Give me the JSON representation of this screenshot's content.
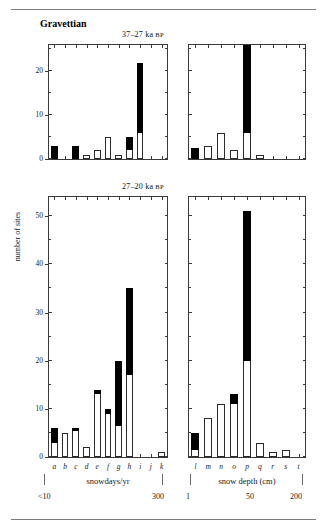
{
  "figure": {
    "culture_label": "Gravettian",
    "y_axis_label": "number of sites"
  },
  "titles": {
    "top": "37–27 ka ",
    "top_sc": "BP",
    "bottom": "27–20 ka ",
    "bottom_sc": "BP"
  },
  "axes": {
    "left_name": "snowdays/yr",
    "right_name": "snow depth (cm)",
    "left_start": "<10",
    "left_end": "300",
    "right_start": "1",
    "right_mid": "50",
    "right_end": "200"
  },
  "categories": {
    "snowdays": [
      "a",
      "b",
      "c",
      "d",
      "e",
      "f",
      "g",
      "h",
      "i",
      "j",
      "k"
    ],
    "snowdepth": [
      "l",
      "m",
      "n",
      "o",
      "p",
      "q",
      "r",
      "s",
      "t"
    ]
  },
  "colors": {
    "filled": "#000000",
    "open": "#ffffff",
    "outline": "#2b2b2b",
    "frame": "#3a3a3a"
  },
  "chart_data": [
    {
      "type": "bar",
      "id": "top-left",
      "title": "37–27 ka BP",
      "xlabel": "snowdays/yr",
      "ylabel": "number of sites",
      "ylim": [
        0,
        26
      ],
      "yticks": [
        0,
        10,
        20
      ],
      "grid": false,
      "legend": null,
      "stacked": true,
      "categories": [
        "a",
        "b",
        "c",
        "d",
        "e",
        "f",
        "g",
        "h",
        "i",
        "j",
        "k"
      ],
      "series": [
        {
          "name": "open",
          "values": [
            0,
            0,
            0,
            1,
            2,
            5,
            1,
            2,
            6,
            0,
            0
          ]
        },
        {
          "name": "filled",
          "values": [
            3,
            0,
            3,
            0,
            0,
            0,
            0,
            3,
            16,
            0,
            0
          ]
        }
      ],
      "totals": [
        3,
        0,
        3,
        1,
        2,
        5,
        1,
        5,
        22,
        0,
        0
      ]
    },
    {
      "type": "bar",
      "id": "top-right",
      "title": "37–27 ka BP",
      "xlabel": "snow depth (cm)",
      "ylabel": "number of sites",
      "ylim": [
        0,
        26
      ],
      "yticks": [
        0,
        10,
        20
      ],
      "grid": false,
      "legend": null,
      "stacked": true,
      "categories": [
        "l",
        "m",
        "n",
        "o",
        "p",
        "q",
        "r",
        "s",
        "t"
      ],
      "series": [
        {
          "name": "open",
          "values": [
            0,
            3,
            6,
            2,
            6,
            1,
            0,
            0,
            0
          ]
        },
        {
          "name": "filled",
          "values": [
            2.5,
            0,
            0,
            0,
            20,
            0,
            0,
            0,
            0
          ]
        }
      ],
      "totals": [
        2.5,
        3,
        6,
        2,
        26,
        1,
        0,
        0,
        0
      ]
    },
    {
      "type": "bar",
      "id": "bottom-left",
      "title": "27–20 ka BP",
      "xlabel": "snowdays/yr",
      "ylabel": "number of sites",
      "ylim": [
        0,
        54
      ],
      "yticks": [
        0,
        10,
        20,
        30,
        40,
        50
      ],
      "grid": false,
      "legend": null,
      "stacked": true,
      "categories": [
        "a",
        "b",
        "c",
        "d",
        "e",
        "f",
        "g",
        "h",
        "i",
        "j",
        "k"
      ],
      "series": [
        {
          "name": "open",
          "values": [
            3,
            5,
            5.5,
            2,
            13,
            9,
            6.5,
            17,
            0,
            0,
            1
          ]
        },
        {
          "name": "filled",
          "values": [
            3,
            0,
            0.5,
            0,
            1,
            1,
            13.5,
            18,
            0,
            0,
            0
          ]
        }
      ],
      "totals": [
        6,
        5,
        6,
        2,
        14,
        10,
        20,
        35,
        0,
        0,
        1
      ]
    },
    {
      "type": "bar",
      "id": "bottom-right",
      "title": "27–20 ka BP",
      "xlabel": "snow depth (cm)",
      "ylabel": "number of sites",
      "ylim": [
        0,
        54
      ],
      "yticks": [
        0,
        10,
        20,
        30,
        40,
        50
      ],
      "grid": false,
      "legend": null,
      "stacked": true,
      "categories": [
        "l",
        "m",
        "n",
        "o",
        "p",
        "q",
        "r",
        "s",
        "t"
      ],
      "series": [
        {
          "name": "open",
          "values": [
            1.5,
            8,
            11,
            11,
            20,
            3,
            1,
            1.5,
            0
          ]
        },
        {
          "name": "filled",
          "values": [
            3.5,
            0,
            0,
            2,
            31,
            0,
            0,
            0,
            0
          ]
        }
      ],
      "totals": [
        5,
        8,
        11,
        13,
        51,
        3,
        1,
        1.5,
        0
      ]
    }
  ]
}
